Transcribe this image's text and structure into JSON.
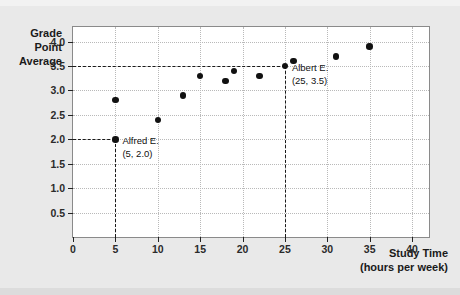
{
  "chart_data": {
    "type": "scatter",
    "title": "",
    "xlabel": "Study Time",
    "xlabel_unit": "(hours per week)",
    "ylabel_lines": [
      "Grade",
      "Point",
      "Average"
    ],
    "xlim": [
      0,
      42
    ],
    "ylim": [
      0,
      4.3
    ],
    "grid": true,
    "legend": "none",
    "xticks": [
      0,
      5,
      10,
      15,
      20,
      25,
      30,
      35,
      40
    ],
    "xtick_labels": [
      "0",
      "5",
      "10",
      "15",
      "20",
      "25",
      "30",
      "35",
      "40"
    ],
    "yticks": [
      0.5,
      1.0,
      1.5,
      2.0,
      2.5,
      3.0,
      3.5,
      4.0
    ],
    "ytick_labels": [
      "0.5",
      "1.0",
      "1.5",
      "2.0",
      "2.5",
      "3.0",
      "3.5",
      "4.0"
    ],
    "points": [
      {
        "x": 5,
        "y": 2.8
      },
      {
        "x": 5,
        "y": 2.0
      },
      {
        "x": 10,
        "y": 2.4
      },
      {
        "x": 13,
        "y": 2.9
      },
      {
        "x": 15,
        "y": 3.3
      },
      {
        "x": 18,
        "y": 3.2
      },
      {
        "x": 19,
        "y": 3.4
      },
      {
        "x": 22,
        "y": 3.3
      },
      {
        "x": 25,
        "y": 3.5
      },
      {
        "x": 26,
        "y": 3.6
      },
      {
        "x": 31,
        "y": 3.7
      },
      {
        "x": 35,
        "y": 3.9
      }
    ],
    "annotations": [
      {
        "name": "Alfred E.",
        "coords": "(5, 2.0)",
        "x": 5,
        "y": 2.0
      },
      {
        "name": "Albert E.",
        "coords": "(25, 3.5)",
        "x": 25,
        "y": 3.5
      }
    ],
    "guides": [
      {
        "orientation": "horizontal",
        "value": 2.0,
        "from_x": 0,
        "to_x": 5
      },
      {
        "orientation": "vertical",
        "value": 5,
        "from_y": 0,
        "to_y": 2.0
      },
      {
        "orientation": "horizontal",
        "value": 3.5,
        "from_x": 0,
        "to_x": 25
      },
      {
        "orientation": "vertical",
        "value": 25,
        "from_y": 0,
        "to_y": 3.5
      }
    ],
    "colors": {
      "point": "#111111",
      "guide": "#1a1a1a",
      "grid": "#b9b9b9",
      "frame": "#8a8a8a",
      "plot_background": "#ffffff",
      "page_background": "#e9e9e9",
      "text": "#1a1a1a"
    }
  }
}
